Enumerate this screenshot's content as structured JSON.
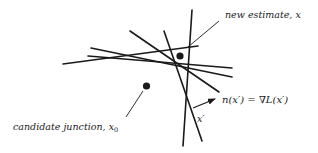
{
  "diagram": {
    "labels": {
      "new_estimate": "new estimate, x",
      "candidate_junction": "candidate junction, x",
      "candidate_subscript": "0",
      "normal_eq_left": "n(x′) = ∇L(x′)",
      "x_prime": "x′"
    },
    "colors": {
      "ink": "#1a1a1a",
      "background": "#ffffff"
    },
    "lines": [
      {
        "x1": 63,
        "y1": 64,
        "x2": 198,
        "y2": 46
      },
      {
        "x1": 88,
        "y1": 56,
        "x2": 232,
        "y2": 68
      },
      {
        "x1": 91,
        "y1": 48,
        "x2": 232,
        "y2": 77
      },
      {
        "x1": 130,
        "y1": 31,
        "x2": 219,
        "y2": 92
      },
      {
        "x1": 164,
        "y1": 31,
        "x2": 202,
        "y2": 141
      },
      {
        "x1": 192,
        "y1": 10,
        "x2": 183,
        "y2": 146
      }
    ],
    "points": {
      "new_estimate": {
        "cx": 180,
        "cy": 56
      },
      "candidate": {
        "cx": 146.5,
        "cy": 86
      }
    }
  }
}
